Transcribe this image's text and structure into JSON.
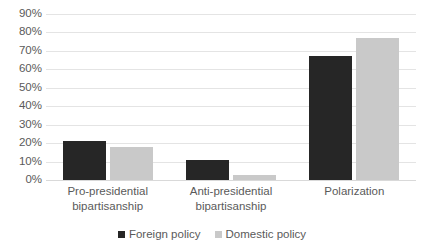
{
  "chart_data": {
    "type": "bar",
    "title": "",
    "subtitle": "",
    "xlabel": "",
    "ylabel": "",
    "categories": [
      "Pro-presidential bipartisanship",
      "Anti-presidential bipartisanship",
      "Polarization"
    ],
    "category_lines": [
      [
        "Pro-presidential",
        "bipartisanship"
      ],
      [
        "Anti-presidential",
        "bipartisanship"
      ],
      [
        "Polarization"
      ]
    ],
    "series": [
      {
        "name": "Foreign policy",
        "color": "#262626",
        "values": [
          21,
          11,
          67
        ]
      },
      {
        "name": "Domestic policy",
        "color": "#c9c9c9",
        "values": [
          18,
          2.5,
          77
        ]
      }
    ],
    "ylim": [
      0,
      90
    ],
    "ytick_values": [
      0,
      10,
      20,
      30,
      40,
      50,
      60,
      70,
      80,
      90
    ],
    "ytick_labels": [
      "0%",
      "10%",
      "20%",
      "30%",
      "40%",
      "50%",
      "60%",
      "70%",
      "80%",
      "90%"
    ],
    "value_suffix": "%",
    "grid": true,
    "grid_axis": "y",
    "legend_position": "bottom",
    "legend_entries": [
      "Foreign policy",
      "Domestic policy"
    ],
    "annotations": []
  }
}
